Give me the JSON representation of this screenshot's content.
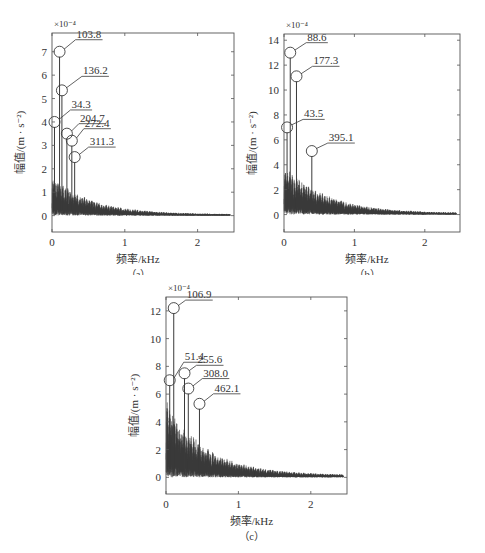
{
  "figure": {
    "panels": [
      "a",
      "b",
      "c"
    ]
  },
  "chart_data": [
    {
      "id": "a",
      "type": "line",
      "caption": "（a）",
      "title": "",
      "xlabel": "频率/kHz",
      "ylabel": "幅值/(m · s⁻²)",
      "y_scale_label": "×10⁻⁴",
      "xlim": [
        0,
        2.5
      ],
      "ylim": [
        -0.7,
        7.8
      ],
      "xticks": [
        0,
        1,
        2
      ],
      "yticks": [
        0,
        1,
        2,
        3,
        4,
        5,
        6,
        7
      ],
      "grid": false,
      "legend": null,
      "noise_envelope": {
        "base_amplitude": 1.5,
        "decay_kHz": 0.55,
        "floor": 0.05,
        "end_kHz": 2.45
      },
      "annotated_peaks": [
        {
          "freq_Hz": 103.8,
          "label": "103.8",
          "amplitude": 7.0,
          "label_dx": 16,
          "label_dy": -14
        },
        {
          "freq_Hz": 136.2,
          "label": "136.2",
          "amplitude": 5.35,
          "label_dx": 20,
          "label_dy": -16
        },
        {
          "freq_Hz": 34.3,
          "label": "34.3",
          "amplitude": 4.0,
          "label_dx": 16,
          "label_dy": -14
        },
        {
          "freq_Hz": 204.7,
          "label": "204.7",
          "amplitude": 3.5,
          "label_dx": 12,
          "label_dy": -12
        },
        {
          "freq_Hz": 272.4,
          "label": "272.4",
          "amplitude": 3.2,
          "label_dx": 12,
          "label_dy": -14
        },
        {
          "freq_Hz": 311.3,
          "label": "311.3",
          "amplitude": 2.5,
          "label_dx": 14,
          "label_dy": -12
        }
      ]
    },
    {
      "id": "b",
      "type": "line",
      "caption": "（b）",
      "title": "",
      "xlabel": "频率/kHz",
      "ylabel": "幅值/(m · s⁻²)",
      "y_scale_label": "×10⁻⁴",
      "xlim": [
        0,
        2.5
      ],
      "ylim": [
        -1.4,
        14.5
      ],
      "xticks": [
        0,
        1,
        2
      ],
      "yticks": [
        0,
        2,
        4,
        6,
        8,
        10,
        12,
        14
      ],
      "grid": false,
      "legend": null,
      "noise_envelope": {
        "base_amplitude": 3.6,
        "decay_kHz": 0.6,
        "floor": 0.1,
        "end_kHz": 2.45
      },
      "annotated_peaks": [
        {
          "freq_Hz": 88.6,
          "label": "88.6",
          "amplitude": 13.0,
          "label_dx": 16,
          "label_dy": -12
        },
        {
          "freq_Hz": 177.3,
          "label": "177.3",
          "amplitude": 11.1,
          "label_dx": 16,
          "label_dy": -12
        },
        {
          "freq_Hz": 43.5,
          "label": "43.5",
          "amplitude": 7.0,
          "label_dx": 16,
          "label_dy": -10
        },
        {
          "freq_Hz": 395.1,
          "label": "395.1",
          "amplitude": 5.1,
          "label_dx": 16,
          "label_dy": -10
        }
      ]
    },
    {
      "id": "c",
      "type": "line",
      "caption": "（c）",
      "title": "",
      "xlabel": "频率/kHz",
      "ylabel": "幅值/(m · s⁻²)",
      "y_scale_label": "×10⁻⁴",
      "xlim": [
        0,
        2.5
      ],
      "ylim": [
        -1.2,
        13.0
      ],
      "xticks": [
        0,
        1,
        2
      ],
      "yticks": [
        0,
        2,
        4,
        6,
        8,
        10,
        12
      ],
      "grid": false,
      "legend": null,
      "noise_envelope": {
        "base_amplitude": 5.0,
        "decay_kHz": 0.55,
        "floor": 0.15,
        "end_kHz": 2.45
      },
      "annotated_peaks": [
        {
          "freq_Hz": 106.9,
          "label": "106.9",
          "amplitude": 12.2,
          "label_dx": 12,
          "label_dy": -10
        },
        {
          "freq_Hz": 51.4,
          "label": "51.4",
          "amplitude": 7.0,
          "label_dx": 14,
          "label_dy": -20
        },
        {
          "freq_Hz": 255.6,
          "label": "255.6",
          "amplitude": 7.5,
          "label_dx": 12,
          "label_dy": -10
        },
        {
          "freq_Hz": 308.0,
          "label": "308.0",
          "amplitude": 6.4,
          "label_dx": 14,
          "label_dy": -12
        },
        {
          "freq_Hz": 462.1,
          "label": "462.1",
          "amplitude": 5.3,
          "label_dx": 14,
          "label_dy": -12
        }
      ]
    }
  ]
}
